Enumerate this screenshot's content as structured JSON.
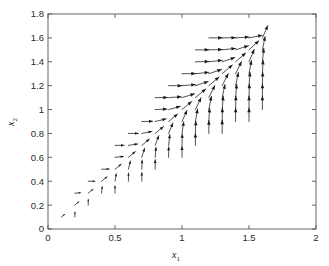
{
  "chart_data": {
    "type": "scatter",
    "subtype": "quiver",
    "title": "",
    "xlabel": "x_1",
    "xlabel_base": "x",
    "xlabel_sub": "1",
    "ylabel": "x_2",
    "ylabel_base": "x",
    "ylabel_sub": "2",
    "xlim": [
      0,
      2
    ],
    "ylim": [
      0,
      1.8
    ],
    "xticks": [
      0,
      0.5,
      1,
      1.5,
      2
    ],
    "xtick_labels": [
      "0",
      "0.5",
      "1",
      "1.5",
      "2"
    ],
    "yticks": [
      0,
      0.2,
      0.4,
      0.6,
      0.8,
      1,
      1.2,
      1.4,
      1.6,
      1.8
    ],
    "ytick_labels": [
      "0",
      "0.2",
      "0.4",
      "0.6",
      "0.8",
      "1",
      "1.2",
      "1.4",
      "1.6",
      "1.8"
    ],
    "grid": false,
    "legend": null,
    "box": true,
    "tick_direction": "in",
    "arrow_color": "#1a1a1a",
    "axis_color": "#555555",
    "background": "#ffffff",
    "grid_step": 0.1,
    "equilibrium_point": [
      1.6,
      1.62
    ],
    "field_description": "Arrows on a 0.1 x 0.1 grid inside a wedge-shaped region, all directed toward the attractor near (1.6, 1.62); arrow length grows with distance from the attractor. Arrows near the left boundary are horizontal (pointing right); arrows near the lower boundary are vertical (pointing up).",
    "domain_lower_slope": 0.62,
    "domain_upper_slope": 1.35,
    "x_domain": [
      0.05,
      1.6
    ],
    "y_domain": [
      0.05,
      1.62
    ]
  },
  "figure": {
    "plot_left_px": 48,
    "plot_right_px": 316,
    "plot_top_px": 14,
    "plot_bottom_px": 229
  }
}
